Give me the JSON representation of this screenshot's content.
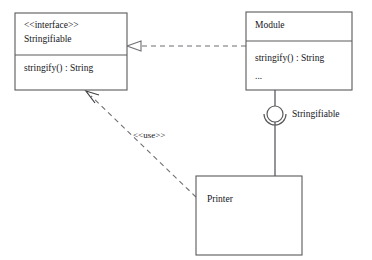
{
  "diagram": {
    "kind": "uml-class-diagram",
    "background_color": "#ffffff",
    "line_color": "#5a5a5a",
    "text_color": "#15151a"
  },
  "interface_box": {
    "stereotype": "<<interface>>",
    "name": "Stringifiable",
    "operation": "stringify() : String"
  },
  "module_box": {
    "name": "Module",
    "operation": "stringify() : String",
    "ellipsis": "..."
  },
  "printer_box": {
    "name": "Printer"
  },
  "lollipop": {
    "label": "Stringifiable"
  },
  "dependency": {
    "stereotype": "<<use>>"
  }
}
